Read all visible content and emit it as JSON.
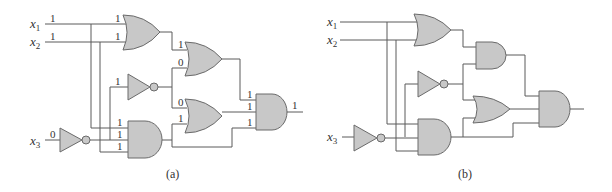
{
  "figure": {
    "panels": [
      {
        "id": "a",
        "caption": "(a)",
        "inputs": [
          {
            "name": "x",
            "sub": "1",
            "value": "1"
          },
          {
            "name": "x",
            "sub": "2",
            "value": "1"
          },
          {
            "name": "x",
            "sub": "3",
            "value": "0"
          }
        ],
        "gates": [
          {
            "id": "or1",
            "type": "OR",
            "inputs": [
              "1",
              "1"
            ]
          },
          {
            "id": "not1",
            "type": "NOT",
            "inputs": [
              "1"
            ]
          },
          {
            "id": "not_x3",
            "type": "NOT",
            "inputs": [
              "0"
            ]
          },
          {
            "id": "and1",
            "type": "AND",
            "inputs": [
              "1",
              "1",
              "1"
            ]
          },
          {
            "id": "or2",
            "type": "OR",
            "inputs": [
              "1",
              "0"
            ]
          },
          {
            "id": "or3",
            "type": "OR",
            "inputs": [
              "0",
              "1"
            ]
          },
          {
            "id": "and_out",
            "type": "AND",
            "inputs": [
              "1",
              "1",
              "1"
            ],
            "output": "1"
          }
        ]
      },
      {
        "id": "b",
        "caption": "(b)",
        "inputs": [
          {
            "name": "x",
            "sub": "1"
          },
          {
            "name": "x",
            "sub": "2"
          },
          {
            "name": "x",
            "sub": "3"
          }
        ],
        "gates": [
          {
            "id": "or1",
            "type": "OR"
          },
          {
            "id": "not1",
            "type": "NOT"
          },
          {
            "id": "not_x3",
            "type": "NOT"
          },
          {
            "id": "and1",
            "type": "AND"
          },
          {
            "id": "and2",
            "type": "AND"
          },
          {
            "id": "or2",
            "type": "OR"
          },
          {
            "id": "and_out",
            "type": "AND"
          }
        ]
      }
    ]
  },
  "labels": {
    "x": "x",
    "s1": "1",
    "s2": "2",
    "s3": "3",
    "one": "1",
    "zero": "0",
    "cap_a": "(a)",
    "cap_b": "(b)"
  }
}
